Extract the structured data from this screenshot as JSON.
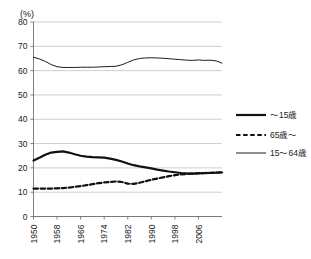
{
  "chart_data": {
    "type": "line",
    "title": "",
    "xlabel": "",
    "ylabel": "",
    "y_unit_label": "(%)",
    "ylim": [
      0,
      80
    ],
    "xlim": [
      1950,
      2014
    ],
    "grid": true,
    "legend_position": "right",
    "yticks": [
      0,
      10,
      20,
      30,
      40,
      50,
      60,
      70,
      80
    ],
    "ytick_labels": [
      "0",
      "10",
      "20",
      "30",
      "40",
      "50",
      "60",
      "70",
      "80"
    ],
    "xticks": [
      1950,
      1958,
      1966,
      1974,
      1982,
      1990,
      1998,
      2006
    ],
    "xtick_labels": [
      "1950",
      "1958",
      "1966",
      "1974",
      "1982",
      "1990",
      "1998",
      "2006"
    ],
    "x": [
      1950,
      1952,
      1954,
      1956,
      1958,
      1960,
      1962,
      1964,
      1966,
      1968,
      1970,
      1972,
      1974,
      1976,
      1978,
      1980,
      1982,
      1984,
      1986,
      1988,
      1990,
      1992,
      1994,
      1996,
      1998,
      2000,
      2002,
      2004,
      2006,
      2008,
      2010,
      2012,
      2014
    ],
    "series": [
      {
        "name": "〜15歳",
        "style": "thick-solid",
        "color": "#111111",
        "values": [
          23.0,
          24.2,
          25.4,
          26.3,
          26.6,
          26.8,
          26.3,
          25.6,
          25.0,
          24.6,
          24.4,
          24.3,
          24.2,
          23.8,
          23.3,
          22.6,
          21.8,
          21.1,
          20.6,
          20.2,
          19.8,
          19.3,
          18.9,
          18.5,
          18.2,
          17.9,
          17.7,
          17.6,
          17.7,
          17.8,
          17.9,
          18.0,
          18.1
        ]
      },
      {
        "name": "65歳〜",
        "style": "dashed",
        "color": "#111111",
        "values": [
          11.5,
          11.5,
          11.5,
          11.5,
          11.6,
          11.7,
          11.9,
          12.2,
          12.5,
          12.9,
          13.3,
          13.7,
          14.0,
          14.2,
          14.4,
          14.2,
          13.5,
          13.4,
          13.9,
          14.5,
          15.1,
          15.6,
          16.1,
          16.6,
          17.0,
          17.3,
          17.5,
          17.6,
          17.8,
          17.9,
          18.0,
          18.1,
          18.2
        ]
      },
      {
        "name": "15〜64歳",
        "style": "thin-solid",
        "color": "#111111",
        "values": [
          65.5,
          64.8,
          63.8,
          62.5,
          61.6,
          61.3,
          61.3,
          61.3,
          61.4,
          61.4,
          61.4,
          61.5,
          61.6,
          61.7,
          61.8,
          62.4,
          63.4,
          64.4,
          65.0,
          65.2,
          65.3,
          65.2,
          65.1,
          64.9,
          64.7,
          64.5,
          64.3,
          64.2,
          64.4,
          64.2,
          64.3,
          64.0,
          63.1
        ]
      }
    ],
    "legend": [
      {
        "label": "〜15歳",
        "style": "thick-solid"
      },
      {
        "label": "65歳〜",
        "style": "dashed"
      },
      {
        "label": "15〜64歳",
        "style": "thin-solid"
      }
    ]
  }
}
